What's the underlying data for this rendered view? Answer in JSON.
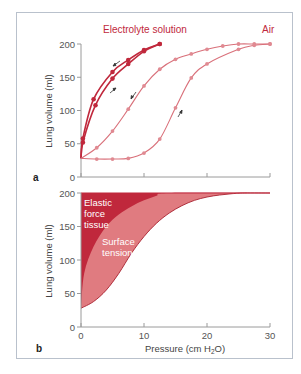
{
  "colors": {
    "frame": "#b9c1cc",
    "axis": "#9a9a9a",
    "tick_label": "#555555",
    "electrolyte": "#c0283c",
    "air": "#d9707a",
    "air_marker": "#e08a92",
    "elastic_fill": "#c0283c",
    "surface_fill": "#e07b80",
    "arrow": "#333333"
  },
  "chart_data": [
    {
      "panel": "a",
      "type": "line",
      "title": "",
      "xlabel": "",
      "ylabel": "Lung volume (ml)",
      "xlim": [
        0,
        30
      ],
      "ylim": [
        0,
        200
      ],
      "xticks": [
        0,
        10,
        20,
        30
      ],
      "yticks": [
        0,
        50,
        100,
        150,
        200
      ],
      "ytick_labels": [
        "0",
        "50",
        "100",
        "150",
        "200"
      ],
      "grid": false,
      "annotations": [
        "Electrolyte solution",
        "Air"
      ],
      "series": [
        {
          "name": "Electrolyte solution (deflation)",
          "medium": "Electrolyte solution",
          "direction": "deflation",
          "x": [
            0,
            0.3,
            2,
            5,
            7.5,
            10,
            12.5
          ],
          "y": [
            28,
            58,
            117,
            158,
            176,
            191,
            200
          ]
        },
        {
          "name": "Electrolyte solution (inflation)",
          "medium": "Electrolyte solution",
          "direction": "inflation",
          "x": [
            0,
            0.3,
            2.3,
            5,
            7.5,
            10,
            12.5
          ],
          "y": [
            28,
            52,
            108,
            148,
            170,
            189,
            200
          ]
        },
        {
          "name": "Air (deflation)",
          "medium": "Air",
          "direction": "deflation",
          "x": [
            0,
            2.5,
            5,
            7.5,
            10,
            12.5,
            15,
            17.5,
            20,
            22.5,
            25,
            27.5,
            30
          ],
          "y": [
            28,
            44,
            69,
            102,
            137,
            162,
            177,
            185,
            192,
            197,
            200,
            200,
            200
          ]
        },
        {
          "name": "Air (inflation)",
          "medium": "Air",
          "direction": "inflation",
          "x": [
            0,
            2.5,
            5,
            7.5,
            10,
            12.5,
            15,
            17.5,
            20,
            25,
            27.5,
            30
          ],
          "y": [
            28,
            27,
            27,
            28,
            36,
            57,
            104,
            149,
            170,
            192,
            198,
            200
          ]
        }
      ]
    },
    {
      "panel": "b",
      "type": "area",
      "title": "",
      "xlabel": "Pressure (cm H2O)",
      "ylabel": "Lung volume (ml)",
      "xlim": [
        0,
        30
      ],
      "ylim": [
        0,
        200
      ],
      "xticks": [
        0,
        10,
        20,
        30
      ],
      "xtick_labels": [
        "0",
        "10",
        "20",
        "30"
      ],
      "yticks": [
        0,
        50,
        100,
        150,
        200
      ],
      "ytick_labels": [
        "0",
        "50",
        "100",
        "150",
        "200"
      ],
      "grid": false,
      "annotations": [
        "Elastic force tissue",
        "Surface tension"
      ],
      "series": [
        {
          "name": "Electrolyte solution curve (upper boundary of elastic region)",
          "x": [
            0,
            0.5,
            2,
            4,
            6,
            8,
            10,
            12,
            14,
            30
          ],
          "y": [
            28,
            80,
            120,
            150,
            168,
            180,
            189,
            196,
            200,
            200
          ]
        },
        {
          "name": "Air curve (lower boundary of surface tension region)",
          "x": [
            0,
            2,
            4,
            6,
            8,
            10,
            12,
            14,
            16,
            18,
            20,
            22,
            24,
            26,
            30
          ],
          "y": [
            28,
            38,
            55,
            80,
            110,
            135,
            155,
            170,
            181,
            189,
            194,
            197,
            199,
            200,
            200
          ]
        }
      ],
      "regions": [
        {
          "name": "Elastic force tissue",
          "between": [
            "y-axis",
            "Electrolyte solution curve"
          ],
          "color": "#c0283c"
        },
        {
          "name": "Surface tension",
          "between": [
            "Electrolyte solution curve",
            "Air curve"
          ],
          "color": "#e07b80"
        }
      ]
    }
  ],
  "labels": {
    "electrolyte": "Electrolyte solution",
    "air": "Air",
    "panel_a": "a",
    "panel_b": "b",
    "ylabel_a": "Lung volume (ml)",
    "ylabel_b": "Lung volume (ml)",
    "elastic_1": "Elastic",
    "elastic_2": "force",
    "elastic_3": "tissue",
    "surface_1": "Surface",
    "surface_2": "tension",
    "xlabel_main": "Pressure (cm H",
    "xlabel_sub": "2",
    "xlabel_end": "O)",
    "yt": [
      "0",
      "50",
      "100",
      "150",
      "200"
    ],
    "xt": [
      "0",
      "10",
      "20",
      "30"
    ]
  }
}
